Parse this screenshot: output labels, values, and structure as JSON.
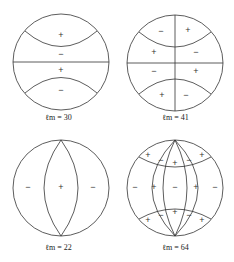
{
  "panels": [
    {
      "id": "lm30",
      "label": "ℓm = 30",
      "signs": [
        "+",
        "−",
        "+",
        "−"
      ]
    },
    {
      "id": "lm41",
      "label": "ℓm = 41",
      "signs": [
        "−",
        "+",
        "+",
        "−",
        "−",
        "+",
        "+",
        "−"
      ]
    },
    {
      "id": "lm22",
      "label": "ℓm = 22",
      "signs": [
        "−",
        "+",
        "−"
      ]
    },
    {
      "id": "lm64",
      "label": "ℓm = 64",
      "signs": [
        "+",
        "−",
        "+",
        "−",
        "+",
        "−",
        "+",
        "−",
        "+",
        "−",
        "+",
        "−",
        "+",
        "−",
        "+"
      ]
    }
  ],
  "colors": {
    "line": "#333333",
    "background": "#ffffff"
  }
}
